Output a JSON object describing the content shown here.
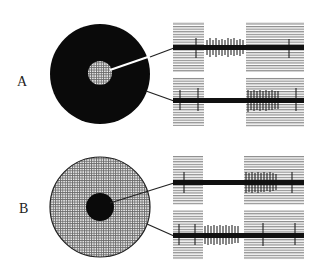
{
  "figure": {
    "panels": [
      {
        "id": "A",
        "label": "A",
        "stimulus": {
          "surround": "dark",
          "center": "light",
          "description": "Dark annulus surround with light stippled center spot"
        },
        "recordings": [
          {
            "electrode": "center",
            "response": "ON burst during unshaded (stimulus) interval",
            "spike_window": "middle"
          },
          {
            "electrode": "surround",
            "response": "OFF burst at start of second shaded interval",
            "spike_window": "late"
          }
        ]
      },
      {
        "id": "B",
        "label": "B",
        "stimulus": {
          "surround": "light",
          "center": "dark",
          "description": "Light stippled surround with dark center spot"
        },
        "recordings": [
          {
            "electrode": "center",
            "response": "OFF burst at start of second shaded interval",
            "spike_window": "late"
          },
          {
            "electrode": "surround",
            "response": "ON burst during unshaded (stimulus) interval",
            "spike_window": "middle"
          }
        ]
      }
    ],
    "colors": {
      "ink": "#111111",
      "stripe": "#8a8a8a",
      "stipple": "#555555",
      "paper": "#ffffff"
    }
  }
}
